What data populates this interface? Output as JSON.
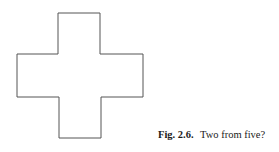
{
  "figure": {
    "shape": "cross (five-square pentomino outline)",
    "stroke_color": "#555555",
    "background": "#ffffff"
  },
  "caption": {
    "label": "Fig. 2.6.",
    "text": "Two from five?"
  }
}
